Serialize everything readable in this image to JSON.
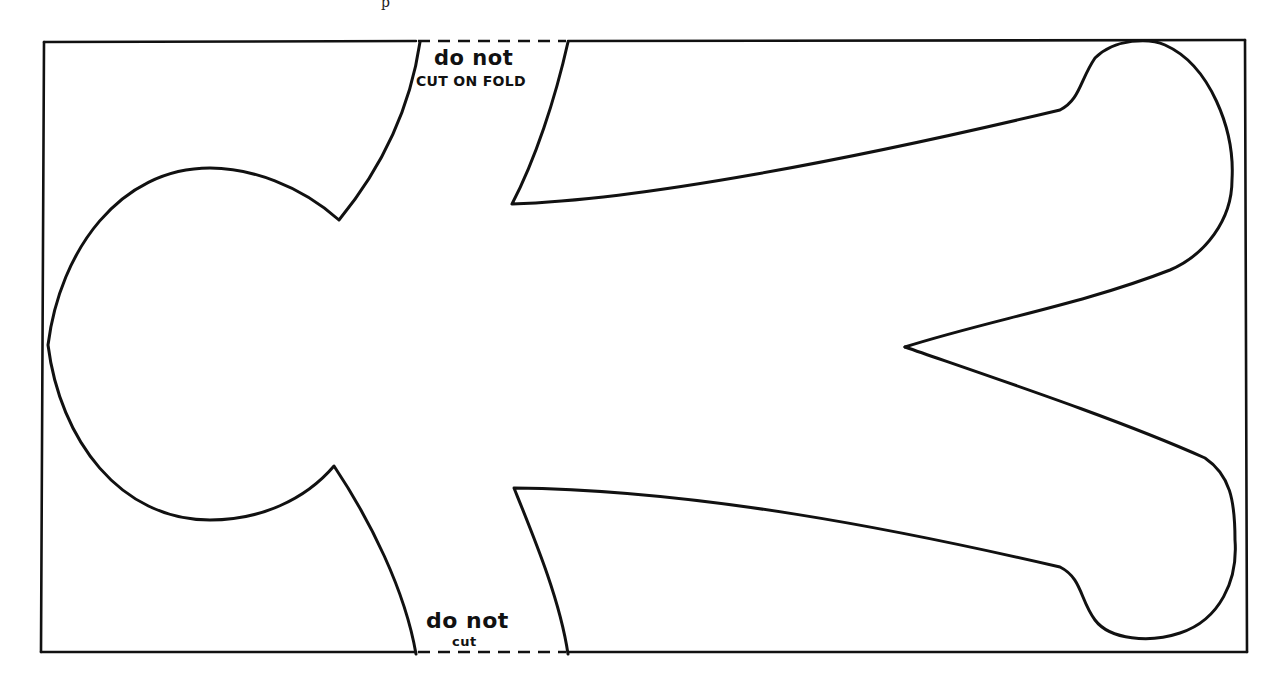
{
  "diagram": {
    "type": "paper-doll cutting template",
    "header_fragment": "p",
    "fold_labels": {
      "top": {
        "line1": "do not",
        "line2": "CUT ON FOLD"
      },
      "bottom": {
        "line1": "do not",
        "line2": "cut"
      }
    },
    "colors": {
      "stroke": "#111111",
      "background": "#ffffff"
    },
    "shapes": [
      "outer-border-rectangle",
      "head",
      "neck",
      "arm-upper",
      "arm-lower",
      "leg-gap-notch",
      "dashed-fold-line-top",
      "dashed-fold-line-bottom"
    ]
  }
}
